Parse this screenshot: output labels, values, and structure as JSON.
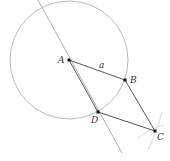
{
  "diagram": {
    "type": "geometric-construction",
    "points": [
      {
        "id": "A",
        "label": "A",
        "x": 69,
        "y": 60,
        "label_dx": -9,
        "label_dy": 3
      },
      {
        "id": "B",
        "label": "B",
        "x": 125,
        "y": 80,
        "label_dx": 5,
        "label_dy": 3
      },
      {
        "id": "C",
        "label": "C",
        "x": 155,
        "y": 131,
        "label_dx": 3,
        "label_dy": 9
      },
      {
        "id": "D",
        "label": "D",
        "x": 98,
        "y": 112,
        "label_dx": -6,
        "label_dy": 11
      }
    ],
    "segments": [
      {
        "from": "A",
        "to": "B",
        "label": "a"
      },
      {
        "from": "B",
        "to": "C",
        "label": ""
      },
      {
        "from": "D",
        "to": "C",
        "label": ""
      },
      {
        "from": "A",
        "to": "D",
        "label": ""
      }
    ],
    "side_label": {
      "text": "a",
      "x": 99,
      "y": 68
    },
    "circle": {
      "center": "A",
      "radius": 59
    },
    "line_through_AD": {
      "x1": 38,
      "y1": 0,
      "x2": 122,
      "y2": 153
    },
    "construction_arcs_near_C": 2,
    "colors": {
      "stroke_main": "#444444",
      "stroke_light": "#999999",
      "stroke_faint": "#cccccc",
      "point": "#111111",
      "label": "#333333"
    }
  }
}
